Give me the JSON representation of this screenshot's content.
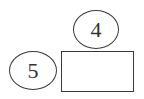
{
  "diagram": {
    "nodes": [
      {
        "id": "oval-top",
        "shape": "ellipse",
        "label": "4"
      },
      {
        "id": "oval-left",
        "shape": "ellipse",
        "label": "5"
      },
      {
        "id": "answer-box",
        "shape": "rectangle",
        "label": ""
      }
    ],
    "colors": {
      "stroke": "#3a3a3a",
      "text": "#333333",
      "background": "#ffffff"
    }
  }
}
